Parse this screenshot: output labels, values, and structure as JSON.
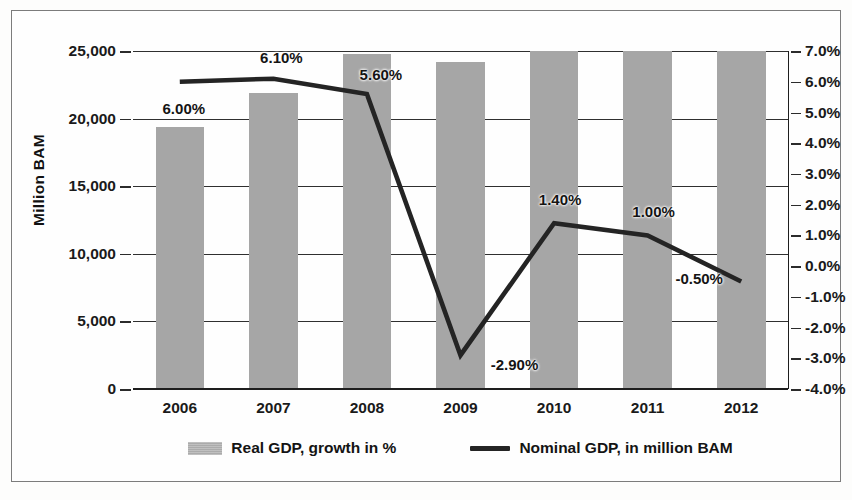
{
  "chart_data": {
    "type": "bar",
    "title": "",
    "subtitle": "",
    "xlabel": "",
    "ylabel": "Million BAM",
    "ylabel_right": "",
    "categories": [
      "2006",
      "2007",
      "2008",
      "2009",
      "2010",
      "2011",
      "2012"
    ],
    "grid": true,
    "legend_position": "bottom",
    "ylim": [
      0,
      25000
    ],
    "ylim_right": [
      -4.0,
      7.0
    ],
    "yticks": [
      "0",
      "5,000",
      "10,000",
      "15,000",
      "20,000",
      "25,000"
    ],
    "ytick_values": [
      0,
      5000,
      10000,
      15000,
      20000,
      25000
    ],
    "yticks_right": [
      "-4.0%",
      "-3.0%",
      "-2.0%",
      "-1.0%",
      "0.0%",
      "1.0%",
      "2.0%",
      "3.0%",
      "4.0%",
      "5.0%",
      "6.0%",
      "7.0%"
    ],
    "ytick_values_right": [
      -4.0,
      -3.0,
      -2.0,
      -1.0,
      0.0,
      1.0,
      2.0,
      3.0,
      4.0,
      5.0,
      6.0,
      7.0
    ],
    "series": [
      {
        "name": "Real GDP, growth in %",
        "render": "bar",
        "axis": "left",
        "color": "#a6a6a6",
        "values": [
          19400,
          21900,
          24800,
          24200,
          25000,
          25000,
          25000
        ],
        "data_labels": [
          "",
          "",
          "",
          "",
          "",
          "",
          ""
        ]
      },
      {
        "name": "Nominal GDP, in million BAM",
        "render": "line",
        "axis": "right",
        "color": "#242424",
        "values": [
          6.0,
          6.1,
          5.6,
          -2.9,
          1.4,
          1.0,
          -0.5
        ],
        "data_labels": [
          "6.00%",
          "6.10%",
          "5.60%",
          "-2.90%",
          "1.40%",
          "1.00%",
          "-0.50%"
        ]
      }
    ]
  },
  "legend": {
    "items": [
      {
        "label": "Real GDP, growth in %",
        "marker": "bar-swatch-icon"
      },
      {
        "label": "Nominal GDP, in million BAM",
        "marker": "line-swatch-icon"
      }
    ]
  },
  "axis": {
    "left_title": "Million BAM"
  }
}
